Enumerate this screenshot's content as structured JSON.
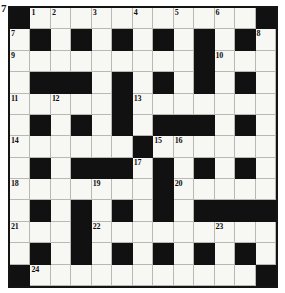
{
  "puzzle": {
    "type": "crossword-grid",
    "corner_mark": "7",
    "rows": 13,
    "columns": 13,
    "colors": {
      "block": "#111111",
      "cell": "#f7f7f4",
      "border": "#141414",
      "gridline": "#b9b9b4",
      "number": "#101010"
    },
    "grid": [
      [
        "#",
        ".",
        ".",
        ".",
        ".",
        ".",
        ".",
        ".",
        ".",
        ".",
        ".",
        ".",
        "#"
      ],
      [
        ".",
        "#",
        ".",
        "#",
        ".",
        "#",
        ".",
        "#",
        ".",
        "#",
        ".",
        "#",
        "."
      ],
      [
        ".",
        ".",
        ".",
        ".",
        ".",
        ".",
        ".",
        ".",
        ".",
        "#",
        ".",
        ".",
        "."
      ],
      [
        ".",
        "#",
        "#",
        "#",
        ".",
        "#",
        ".",
        "#",
        ".",
        "#",
        ".",
        "#",
        "."
      ],
      [
        ".",
        ".",
        ".",
        ".",
        ".",
        "#",
        ".",
        ".",
        ".",
        ".",
        ".",
        ".",
        "."
      ],
      [
        ".",
        "#",
        ".",
        "#",
        ".",
        "#",
        ".",
        "#",
        "#",
        "#",
        ".",
        "#",
        "."
      ],
      [
        ".",
        ".",
        ".",
        ".",
        ".",
        ".",
        "#",
        ".",
        ".",
        ".",
        ".",
        ".",
        "."
      ],
      [
        ".",
        "#",
        ".",
        "#",
        "#",
        "#",
        ".",
        "#",
        ".",
        "#",
        ".",
        "#",
        "."
      ],
      [
        ".",
        ".",
        ".",
        ".",
        ".",
        ".",
        ".",
        "#",
        ".",
        ".",
        ".",
        ".",
        "."
      ],
      [
        ".",
        "#",
        ".",
        "#",
        ".",
        "#",
        ".",
        "#",
        ".",
        "#",
        "#",
        "#",
        "#"
      ],
      [
        ".",
        ".",
        ".",
        "#",
        ".",
        ".",
        ".",
        ".",
        ".",
        ".",
        ".",
        ".",
        "."
      ],
      [
        ".",
        "#",
        ".",
        "#",
        ".",
        "#",
        ".",
        "#",
        ".",
        "#",
        ".",
        "#",
        "."
      ],
      [
        "#",
        ".",
        ".",
        ".",
        ".",
        ".",
        ".",
        ".",
        ".",
        ".",
        ".",
        ".",
        "#"
      ]
    ],
    "numbers": [
      {
        "row": 0,
        "col": 1,
        "label": "1"
      },
      {
        "row": 0,
        "col": 2,
        "label": "2"
      },
      {
        "row": 0,
        "col": 4,
        "label": "3"
      },
      {
        "row": 0,
        "col": 6,
        "label": "4"
      },
      {
        "row": 0,
        "col": 8,
        "label": "5"
      },
      {
        "row": 0,
        "col": 10,
        "label": "6"
      },
      {
        "row": 1,
        "col": 0,
        "label": "7"
      },
      {
        "row": 1,
        "col": 12,
        "label": "8"
      },
      {
        "row": 2,
        "col": 0,
        "label": "9"
      },
      {
        "row": 2,
        "col": 10,
        "label": "10"
      },
      {
        "row": 4,
        "col": 0,
        "label": "11"
      },
      {
        "row": 4,
        "col": 2,
        "label": "12"
      },
      {
        "row": 4,
        "col": 6,
        "label": "13"
      },
      {
        "row": 6,
        "col": 0,
        "label": "14"
      },
      {
        "row": 6,
        "col": 7,
        "label": "15"
      },
      {
        "row": 6,
        "col": 8,
        "label": "16"
      },
      {
        "row": 7,
        "col": 6,
        "label": "17"
      },
      {
        "row": 8,
        "col": 0,
        "label": "18"
      },
      {
        "row": 8,
        "col": 4,
        "label": "19"
      },
      {
        "row": 8,
        "col": 8,
        "label": "20"
      },
      {
        "row": 10,
        "col": 0,
        "label": "21"
      },
      {
        "row": 10,
        "col": 4,
        "label": "22"
      },
      {
        "row": 10,
        "col": 10,
        "label": "23"
      },
      {
        "row": 12,
        "col": 1,
        "label": "24"
      }
    ]
  }
}
